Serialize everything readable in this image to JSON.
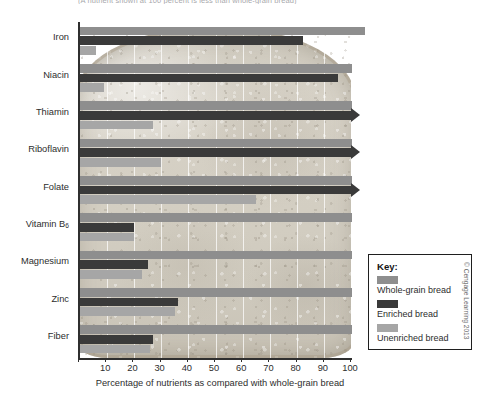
{
  "figure": {
    "top_caption": "(A nutrient shown at 100 percent is less than whole-grain bread)",
    "credit": "© Cengage Learning 2013"
  },
  "chart_data": {
    "type": "bar",
    "orientation": "horizontal",
    "title": "",
    "xlabel": "Percentage of nutrients as compared with whole-grain bread",
    "ylabel": "",
    "xlim": [
      0,
      100
    ],
    "xticks": [
      10,
      20,
      30,
      40,
      50,
      60,
      70,
      80,
      90,
      100
    ],
    "grid": true,
    "legend_position": "right",
    "categories": [
      "Iron",
      "Niacin",
      "Thiamin",
      "Riboflavin",
      "Folate",
      "Vitamin B6",
      "Magnesium",
      "Zinc",
      "Fiber"
    ],
    "category_labels_html": [
      "Iron",
      "Niacin",
      "Thiamin",
      "Riboflavin",
      "Folate",
      "Vitamin B<sub>6</sub>",
      "Magnesium",
      "Zinc",
      "Fiber"
    ],
    "series": [
      {
        "name": "Whole-grain bread",
        "color": "#8e8e8e",
        "values": [
          105,
          100,
          100,
          100,
          100,
          100,
          100,
          100,
          100
        ],
        "overflow": [
          true,
          false,
          false,
          false,
          false,
          false,
          false,
          false,
          false
        ]
      },
      {
        "name": "Enriched bread",
        "color": "#3a3a3a",
        "values": [
          82,
          95,
          100,
          100,
          100,
          20,
          25,
          36,
          27
        ],
        "arrow": [
          false,
          false,
          true,
          true,
          true,
          false,
          false,
          false,
          false
        ]
      },
      {
        "name": "Unenriched bread",
        "color": "#a6a6a6",
        "values": [
          6,
          9,
          27,
          30,
          65,
          20,
          23,
          35,
          26
        ]
      }
    ]
  },
  "legend": {
    "title": "Key:",
    "items": [
      {
        "label": "Whole-grain bread",
        "color": "#8e8e8e"
      },
      {
        "label": "Enriched bread",
        "color": "#3a3a3a"
      },
      {
        "label": "Unenriched bread",
        "color": "#a6a6a6"
      }
    ]
  }
}
